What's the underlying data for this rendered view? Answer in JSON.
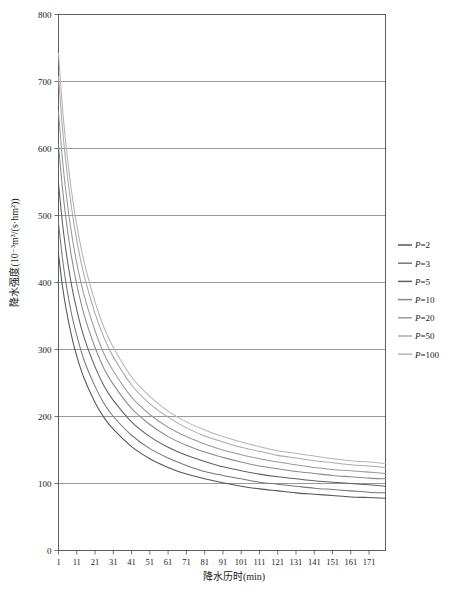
{
  "chart_data": {
    "type": "line",
    "title": "",
    "xlabel": "降水历时(min)",
    "ylabel": "降水强度(10⁻³m³/(s·hm²))",
    "xlim": [
      1,
      180
    ],
    "ylim": [
      0,
      800
    ],
    "ytick_step": 100,
    "grid": "horizontal",
    "legend_position": "right",
    "x_tick_labels": [
      "1",
      "11",
      "21",
      "31",
      "41",
      "51",
      "61",
      "71",
      "81",
      "91",
      "101",
      "111",
      "121",
      "131",
      "141",
      "151",
      "161",
      "171"
    ],
    "x_tick_values": [
      1,
      11,
      21,
      31,
      41,
      51,
      61,
      71,
      81,
      91,
      101,
      111,
      121,
      131,
      141,
      151,
      161,
      171
    ],
    "y_tick_labels": [
      "0",
      "100",
      "200",
      "300",
      "400",
      "500",
      "600",
      "700",
      "800"
    ],
    "y_tick_values": [
      0,
      100,
      200,
      300,
      400,
      500,
      600,
      700,
      800
    ],
    "x": [
      1,
      3,
      5,
      8,
      11,
      15,
      21,
      26,
      31,
      41,
      51,
      61,
      71,
      81,
      91,
      101,
      111,
      121,
      131,
      141,
      151,
      161,
      171,
      180
    ],
    "series": [
      {
        "name": "P=2",
        "legend_label": "P=2",
        "color": "#555555",
        "values": [
          443,
          398,
          363,
          322,
          290,
          257,
          221,
          198,
          181,
          155,
          137,
          124,
          114,
          107,
          101,
          96,
          92,
          89,
          86,
          84,
          82,
          80,
          79,
          78
        ]
      },
      {
        "name": "P=3",
        "legend_label": "P=3",
        "color": "#777777",
        "values": [
          489,
          440,
          401,
          355,
          321,
          284,
          245,
          219,
          200,
          172,
          152,
          138,
          127,
          118,
          112,
          107,
          102,
          99,
          96,
          93,
          91,
          89,
          87,
          86
        ]
      },
      {
        "name": "P=5",
        "legend_label": "P=5",
        "color": "#5f5f5f",
        "values": [
          548,
          493,
          449,
          398,
          359,
          318,
          274,
          245,
          224,
          192,
          170,
          154,
          142,
          133,
          125,
          119,
          114,
          110,
          107,
          104,
          102,
          100,
          98,
          96
        ]
      },
      {
        "name": "P=10",
        "legend_label": "P=10",
        "color": "#8a8a8a",
        "values": [
          606,
          545,
          497,
          440,
          397,
          352,
          303,
          271,
          248,
          212,
          188,
          170,
          157,
          147,
          139,
          132,
          126,
          122,
          118,
          115,
          112,
          110,
          108,
          107
        ]
      },
      {
        "name": "P=20",
        "legend_label": "P=20",
        "color": "#9a9a9a",
        "values": [
          655,
          589,
          537,
          476,
          429,
          381,
          328,
          293,
          268,
          229,
          203,
          184,
          170,
          159,
          150,
          143,
          137,
          132,
          128,
          124,
          121,
          119,
          117,
          115
        ]
      },
      {
        "name": "P=50",
        "legend_label": "P=50",
        "color": "#aaaaaa",
        "values": [
          707,
          636,
          580,
          514,
          463,
          411,
          354,
          317,
          289,
          247,
          219,
          199,
          183,
          171,
          162,
          154,
          148,
          142,
          138,
          134,
          131,
          128,
          126,
          124
        ]
      },
      {
        "name": "P=100",
        "legend_label": "P=100",
        "color": "#b5b5b5",
        "values": [
          742,
          667,
          608,
          539,
          486,
          431,
          371,
          332,
          303,
          259,
          230,
          208,
          192,
          180,
          170,
          162,
          155,
          149,
          145,
          141,
          137,
          134,
          132,
          130
        ]
      }
    ]
  },
  "legend": {
    "items": [
      {
        "label": "P=2"
      },
      {
        "label": "P=3"
      },
      {
        "label": "P=5"
      },
      {
        "label": "P=10"
      },
      {
        "label": "P=20"
      },
      {
        "label": "P=50"
      },
      {
        "label": "P=100"
      }
    ]
  },
  "axes": {
    "x_title": "降水历时(min)",
    "y_title": "降水强度(10⁻³m³/(s·hm²))"
  }
}
